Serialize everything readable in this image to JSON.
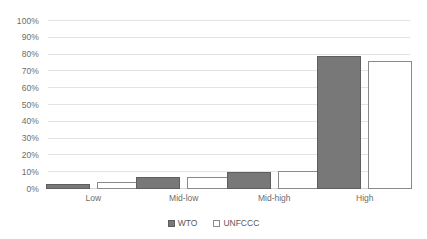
{
  "chart_data": {
    "type": "bar",
    "title": "",
    "subtitle": "",
    "xlabel": "",
    "ylabel": "",
    "categories": [
      "Low",
      "Mid-low",
      "Mid-high",
      "High"
    ],
    "series": [
      {
        "name": "WTO",
        "values": [
          3,
          7,
          10,
          79
        ]
      },
      {
        "name": "UNFCCC",
        "values": [
          4,
          7,
          11,
          76
        ]
      }
    ],
    "ylim": [
      0,
      100
    ],
    "y_ticks": [
      0,
      10,
      20,
      30,
      40,
      50,
      60,
      70,
      80,
      90,
      100
    ],
    "y_tick_labels": [
      "0%",
      "10%",
      "20%",
      "30%",
      "40%",
      "50%",
      "60%",
      "70%",
      "80%",
      "90%",
      "100%"
    ],
    "value_suffix": "%",
    "grid": true,
    "grid_axis": "y",
    "legend": true,
    "legend_position": "bottom",
    "legend_entries": [
      {
        "label": "WTO",
        "swatch": "filled-square-icon",
        "color": "#787878"
      },
      {
        "label": "UNFCCC",
        "swatch": "outlined-square-icon",
        "color": "#ffffff"
      }
    ],
    "colors": {
      "wto_fill": "#787878",
      "wto_border": "#5e5e5e",
      "unfccc_fill": "#ffffff",
      "unfccc_border": "#8a8a8a",
      "gridline": "#e3e3e3",
      "text": "#6d6d6d",
      "background": "#ffffff"
    }
  }
}
